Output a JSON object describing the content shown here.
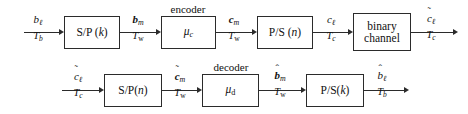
{
  "diagram": {
    "stroke_color": "#2b2b2b",
    "background": "#ffffff",
    "top_chain": {
      "blocks": [
        {
          "id": "sp-k",
          "label": "S/P (k)"
        },
        {
          "id": "encoder",
          "label": "μ_c",
          "caption": "encoder"
        },
        {
          "id": "ps-n",
          "label": "P/S (n)"
        },
        {
          "id": "binary-channel",
          "label_line1": "binary",
          "label_line2": "channel"
        }
      ],
      "signals": [
        {
          "id": "b-l-in",
          "symbol": "b_ℓ",
          "period": "T_b"
        },
        {
          "id": "b-m",
          "symbol": "b_m",
          "period": "T_w"
        },
        {
          "id": "c-m",
          "symbol": "c_m",
          "period": "T_w"
        },
        {
          "id": "c-l",
          "symbol": "c_ℓ",
          "period": "T_c"
        },
        {
          "id": "c-l-tilde-out",
          "symbol": "c̃_ℓ",
          "period": "T_c"
        }
      ]
    },
    "bottom_chain": {
      "blocks": [
        {
          "id": "sp-n",
          "label": "S/P(n)"
        },
        {
          "id": "decoder",
          "label": "μ_d",
          "caption": "decoder"
        },
        {
          "id": "ps-k",
          "label": "P/S(k)"
        }
      ],
      "signals": [
        {
          "id": "c-l-tilde-in",
          "symbol": "c̃_ℓ",
          "period": "T_c"
        },
        {
          "id": "c-m-tilde",
          "symbol": "c̃_m",
          "period": "T_w"
        },
        {
          "id": "b-m-hat",
          "symbol": "b̂_m",
          "period": "T_w"
        },
        {
          "id": "b-l-hat",
          "symbol": "b̂_ℓ",
          "period": "T_b"
        }
      ]
    }
  }
}
